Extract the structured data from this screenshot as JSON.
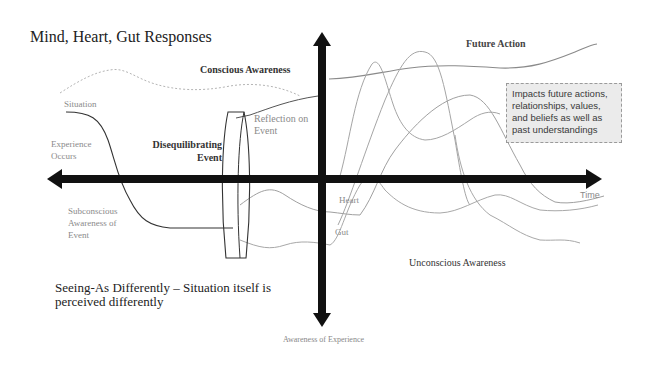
{
  "diagram": {
    "title": "Mind, Heart, Gut Responses",
    "labels": {
      "conscious_awareness": "Conscious Awareness",
      "future_action": "Future Action",
      "situation": "Situation",
      "experience_occurs": "Experience Occurs",
      "disequilibrating_event": "Disequilibrating Event",
      "reflection_on_event": "Reflection on Event",
      "subconscious_awareness": "Subconscious Awareness of Event",
      "heart": "Heart",
      "gut": "Gut",
      "time": "Time",
      "unconscious_awareness": "Unconscious Awareness",
      "awareness_of_experience": "Awareness of Experience",
      "seeing_as": "Seeing-As Differently – Situation itself is perceived differently"
    },
    "callout": {
      "text": "Impacts future actions, relationships, values, and beliefs as well as past understandings"
    },
    "axes": {
      "horizontal": {
        "label": "Time",
        "direction": "bidirectional"
      },
      "vertical": {
        "label": "Awareness of Experience",
        "direction": "bidirectional"
      }
    },
    "colors": {
      "axis": "#111111",
      "mind_line": "#666666",
      "heart_gut_lines": "#9a9a9a",
      "callout_bg": "#ebebeb"
    }
  }
}
